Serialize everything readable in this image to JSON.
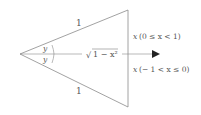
{
  "diagram": {
    "type": "geometry-figure",
    "stroke_color": "#8a8a8a",
    "text_color": "#555555",
    "edges": {
      "upper_side_label": "1",
      "lower_side_label": "1"
    },
    "angles": {
      "upper_angle_label": "y",
      "lower_angle_label": "y"
    },
    "axis": {
      "middle_label_radicand": "1 − x²",
      "middle_label_root": "√",
      "upper_condition_var": "x",
      "upper_condition": "(0 ≤ x < 1)",
      "lower_condition_var": "x",
      "lower_condition": "(− 1 < x ≤ 0)"
    }
  }
}
